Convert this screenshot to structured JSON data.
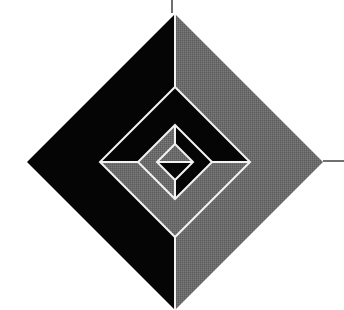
{
  "diagram": {
    "type": "nested-diamonds",
    "center": [
      175,
      162
    ],
    "colors": {
      "background": "#ffffff",
      "dark": "#050505",
      "gray": "#6b6b6b",
      "divider": "#f2f2f2",
      "tick": "#222222"
    },
    "layers": [
      {
        "name": "outer-diamond",
        "half": 148,
        "split": "vertical",
        "first_half_color": "dark",
        "second_half_color": "gray",
        "note": "left dark, right gray"
      },
      {
        "name": "middle-diamond",
        "half": 75,
        "split": "horizontal",
        "first_half_color": "dark",
        "second_half_color": "gray",
        "note": "top dark, bottom gray"
      },
      {
        "name": "inner-diamond",
        "half": 37,
        "split": "vertical",
        "first_half_color": "gray",
        "second_half_color": "dark",
        "note": "left gray, right dark"
      },
      {
        "name": "innermost-diamond",
        "half": 18,
        "split": "horizontal",
        "first_half_color": "gray",
        "second_half_color": "dark",
        "note": "top gray, bottom dark"
      }
    ],
    "ticks": [
      {
        "name": "top-tick",
        "x1": 172,
        "y1": 0,
        "x2": 172,
        "y2": 13
      },
      {
        "name": "right-tick",
        "x1": 323,
        "y1": 161,
        "x2": 344,
        "y2": 161
      }
    ]
  }
}
